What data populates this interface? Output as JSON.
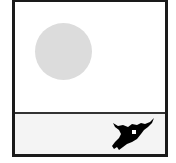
{
  "scene": {
    "name": "game-frame",
    "sky": {
      "background": "#ffffff",
      "sun": {
        "icon": "sun-icon",
        "color": "#dcdcdc"
      }
    },
    "ground": {
      "pattern": "dotted",
      "background": "#f4f4f4",
      "dot_color": "#b8b8b8"
    },
    "creature": {
      "icon": "creature-icon",
      "color": "#000000",
      "eye_color": "#ffffff"
    },
    "border_color": "#1a1a1a"
  }
}
